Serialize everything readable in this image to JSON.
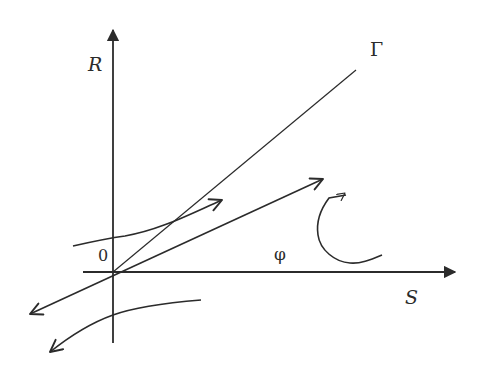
{
  "labels": {
    "y_axis": "R",
    "x_axis": "S",
    "origin": "0",
    "gamma_line": "Γ",
    "angle": "φ"
  },
  "colors": {
    "ink": "#2b2b2b",
    "background": "#ffffff"
  },
  "elements": {
    "axes": [
      "R (vertical, arrow up)",
      "S (horizontal, arrow right)"
    ],
    "lines": [
      "Γ ray from origin up-right"
    ],
    "arrows": [
      "straight double-headed arrow through origin (down-left / up-right)",
      "upper curved arrow pointing up-right",
      "lower curved arrow pointing down-left",
      "hook-shaped curved arrow pointing up"
    ]
  }
}
